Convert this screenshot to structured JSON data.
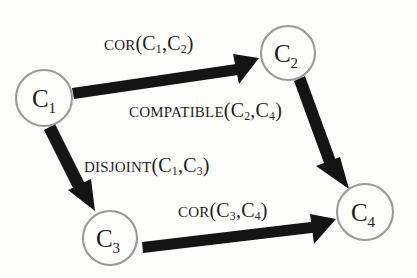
{
  "diagram": {
    "type": "directed-graph",
    "background_color": "#fdfdfb",
    "node_stroke_color": "#9a9a96",
    "arrow_color": "#141414",
    "text_color": "#1b1b1b",
    "nodes": [
      {
        "id": "C1",
        "base": "C",
        "subscript": "1",
        "cx": 44,
        "cy": 98,
        "r": 28
      },
      {
        "id": "C2",
        "base": "C",
        "subscript": "2",
        "cx": 288,
        "cy": 53,
        "r": 27
      },
      {
        "id": "C3",
        "base": "C",
        "subscript": "3",
        "cx": 110,
        "cy": 238,
        "r": 27
      },
      {
        "id": "C4",
        "base": "C",
        "subscript": "4",
        "cx": 365,
        "cy": 212,
        "r": 28
      }
    ],
    "edges": [
      {
        "id": "edge-c1-c2",
        "from": "C1",
        "to": "C2",
        "predicate": "Cor",
        "args": "(C1,C2)",
        "label_text": "Cor(C1,C2)"
      },
      {
        "id": "edge-c2-c4",
        "from": "C2",
        "to": "C4",
        "predicate": "Compatible",
        "args": "(C2,C4)",
        "label_text": "Compatible(C2,C4)"
      },
      {
        "id": "edge-c1-c3",
        "from": "C1",
        "to": "C3",
        "predicate": "Disjoint",
        "args": "(C1,C3)",
        "label_text": "Disjoint(C1,C3)"
      },
      {
        "id": "edge-c3-c4",
        "from": "C3",
        "to": "C4",
        "predicate": "Cor",
        "args": "(C3,C4)",
        "label_text": "Cor(C3,C4)"
      }
    ],
    "labels": {
      "cor_c1_c2": {
        "predicate": "Cor",
        "open": "(C",
        "sub1": "1",
        "comma": ",C",
        "sub2": "2",
        "close": ")"
      },
      "compatible_c2_c4": {
        "predicate": "Compatible",
        "open": "(C",
        "sub1": "2",
        "comma": ",C",
        "sub2": "4",
        "close": ")"
      },
      "disjoint_c1_c3": {
        "predicate": "Disjoint",
        "open": "(C",
        "sub1": "1",
        "comma": ",C",
        "sub2": "3",
        "close": ")"
      },
      "cor_c3_c4": {
        "predicate": "Cor",
        "open": "(C",
        "sub1": "3",
        "comma": ",C",
        "sub2": "4",
        "close": ")"
      }
    }
  }
}
